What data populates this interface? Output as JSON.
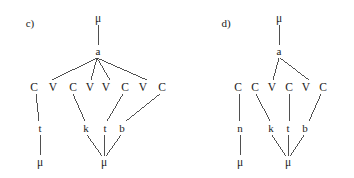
{
  "figure": {
    "background_color": "#ffffff",
    "line_color": "#3c3c3c",
    "text_color": "#1a1a1a",
    "width": 354,
    "height": 178
  },
  "panels": [
    {
      "id": "c",
      "label": "c)",
      "label_pos": {
        "x": 30,
        "y": 23
      },
      "nodes": [
        {
          "name": "mu-top",
          "text": "μ",
          "x": 98,
          "y": 18,
          "cls": "mu"
        },
        {
          "name": "a-root",
          "text": "a",
          "x": 98,
          "y": 51,
          "cls": "seg"
        },
        {
          "name": "skeleton-c1",
          "text": "C",
          "x": 34,
          "y": 87,
          "cls": "cv"
        },
        {
          "name": "skeleton-v1",
          "text": "V",
          "x": 53,
          "y": 87,
          "cls": "cv"
        },
        {
          "name": "skeleton-c2",
          "text": "C",
          "x": 73,
          "y": 87,
          "cls": "cv"
        },
        {
          "name": "skeleton-v2",
          "text": "V",
          "x": 90,
          "y": 87,
          "cls": "cv"
        },
        {
          "name": "skeleton-v3",
          "text": "V",
          "x": 106,
          "y": 87,
          "cls": "cv"
        },
        {
          "name": "skeleton-c3",
          "text": "C",
          "x": 125,
          "y": 87,
          "cls": "cv"
        },
        {
          "name": "skeleton-v4",
          "text": "V",
          "x": 143,
          "y": 87,
          "cls": "cv"
        },
        {
          "name": "skeleton-c4",
          "text": "C",
          "x": 162,
          "y": 87,
          "cls": "cv"
        },
        {
          "name": "seg-t1",
          "text": "t",
          "x": 40,
          "y": 128,
          "cls": "seg"
        },
        {
          "name": "seg-k",
          "text": "k",
          "x": 86,
          "y": 128,
          "cls": "seg"
        },
        {
          "name": "seg-t2",
          "text": "t",
          "x": 105,
          "y": 128,
          "cls": "seg"
        },
        {
          "name": "seg-b",
          "text": "b",
          "x": 122,
          "y": 128,
          "cls": "seg"
        },
        {
          "name": "mu-bottom-1",
          "text": "μ",
          "x": 40,
          "y": 162,
          "cls": "mu"
        },
        {
          "name": "mu-bottom-2",
          "text": "μ",
          "x": 104,
          "y": 162,
          "cls": "mu"
        }
      ],
      "edges": [
        {
          "name": "edge-mutop-a",
          "x1": 98,
          "y1": 25,
          "x2": 98,
          "y2": 45
        },
        {
          "name": "edge-a-v1",
          "x1": 97,
          "y1": 58,
          "x2": 52,
          "y2": 80
        },
        {
          "name": "edge-a-v2",
          "x1": 97,
          "y1": 58,
          "x2": 91,
          "y2": 80
        },
        {
          "name": "edge-a-v3",
          "x1": 97,
          "y1": 58,
          "x2": 110,
          "y2": 80
        },
        {
          "name": "edge-a-v4",
          "x1": 97,
          "y1": 58,
          "x2": 147,
          "y2": 80
        },
        {
          "name": "edge-c1-t1",
          "x1": 36,
          "y1": 94,
          "x2": 39,
          "y2": 121
        },
        {
          "name": "edge-c2-k",
          "x1": 73,
          "y1": 94,
          "x2": 85,
          "y2": 121
        },
        {
          "name": "edge-c3-t2",
          "x1": 123,
          "y1": 94,
          "x2": 107,
          "y2": 121
        },
        {
          "name": "edge-c4-b",
          "x1": 160,
          "y1": 94,
          "x2": 126,
          "y2": 121
        },
        {
          "name": "edge-t1-mu",
          "x1": 40,
          "y1": 135,
          "x2": 40,
          "y2": 155
        },
        {
          "name": "edge-k-mu",
          "x1": 87,
          "y1": 135,
          "x2": 102,
          "y2": 156
        },
        {
          "name": "edge-t2-mu",
          "x1": 105,
          "y1": 135,
          "x2": 104,
          "y2": 156
        },
        {
          "name": "edge-b-mu",
          "x1": 121,
          "y1": 135,
          "x2": 106,
          "y2": 156
        }
      ]
    },
    {
      "id": "d",
      "label": "d)",
      "label_pos": {
        "x": 226,
        "y": 23
      },
      "nodes": [
        {
          "name": "mu-top",
          "text": "μ",
          "x": 279,
          "y": 18,
          "cls": "mu"
        },
        {
          "name": "a-root",
          "text": "a",
          "x": 279,
          "y": 51,
          "cls": "seg"
        },
        {
          "name": "skeleton-c1",
          "text": "C",
          "x": 238,
          "y": 87,
          "cls": "cv"
        },
        {
          "name": "skeleton-c2",
          "text": "C",
          "x": 255,
          "y": 87,
          "cls": "cv"
        },
        {
          "name": "skeleton-v1",
          "text": "V",
          "x": 272,
          "y": 87,
          "cls": "cv"
        },
        {
          "name": "skeleton-c3",
          "text": "C",
          "x": 289,
          "y": 87,
          "cls": "cv"
        },
        {
          "name": "skeleton-v2",
          "text": "V",
          "x": 306,
          "y": 87,
          "cls": "cv"
        },
        {
          "name": "skeleton-c4",
          "text": "C",
          "x": 323,
          "y": 87,
          "cls": "cv"
        },
        {
          "name": "seg-n",
          "text": "n",
          "x": 240,
          "y": 128,
          "cls": "seg"
        },
        {
          "name": "seg-k",
          "text": "k",
          "x": 271,
          "y": 128,
          "cls": "seg"
        },
        {
          "name": "seg-t",
          "text": "t",
          "x": 288,
          "y": 128,
          "cls": "seg"
        },
        {
          "name": "seg-b",
          "text": "b",
          "x": 305,
          "y": 128,
          "cls": "seg"
        },
        {
          "name": "mu-bottom-1",
          "text": "μ",
          "x": 240,
          "y": 162,
          "cls": "mu"
        },
        {
          "name": "mu-bottom-2",
          "text": "μ",
          "x": 288,
          "y": 162,
          "cls": "mu"
        }
      ],
      "edges": [
        {
          "name": "edge-mutop-a",
          "x1": 279,
          "y1": 25,
          "x2": 279,
          "y2": 45
        },
        {
          "name": "edge-a-v1",
          "x1": 279,
          "y1": 58,
          "x2": 273,
          "y2": 80
        },
        {
          "name": "edge-a-v2",
          "x1": 280,
          "y1": 58,
          "x2": 309,
          "y2": 80
        },
        {
          "name": "edge-c1-n",
          "x1": 239,
          "y1": 94,
          "x2": 240,
          "y2": 121
        },
        {
          "name": "edge-c2-k",
          "x1": 256,
          "y1": 94,
          "x2": 270,
          "y2": 121
        },
        {
          "name": "edge-c3-t",
          "x1": 289,
          "y1": 94,
          "x2": 290,
          "y2": 121
        },
        {
          "name": "edge-c4-b",
          "x1": 321,
          "y1": 94,
          "x2": 309,
          "y2": 121
        },
        {
          "name": "edge-n-mu",
          "x1": 240,
          "y1": 135,
          "x2": 240,
          "y2": 155
        },
        {
          "name": "edge-k-mu",
          "x1": 272,
          "y1": 135,
          "x2": 286,
          "y2": 156
        },
        {
          "name": "edge-t-mu",
          "x1": 288,
          "y1": 135,
          "x2": 288,
          "y2": 156
        },
        {
          "name": "edge-b-mu",
          "x1": 304,
          "y1": 135,
          "x2": 290,
          "y2": 156
        }
      ]
    }
  ]
}
